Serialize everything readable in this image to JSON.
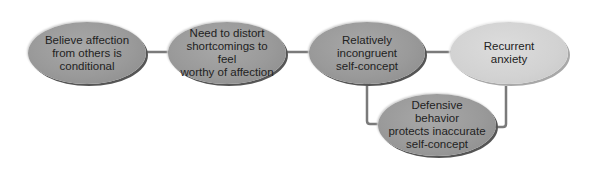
{
  "diagram": {
    "type": "flowchart",
    "nodes": [
      {
        "id": "n1",
        "label": "Believe affection from others is conditional",
        "lines": [
          "Believe affection",
          "from others is",
          "conditional"
        ],
        "shade": "dark"
      },
      {
        "id": "n2",
        "label": "Need to distort shortcomings to feel worthy of affection",
        "lines": [
          "Need to distort",
          "shortcomings to feel",
          "worthy of affection"
        ],
        "shade": "dark"
      },
      {
        "id": "n3",
        "label": "Relatively incongruent self-concept",
        "lines": [
          "Relatively",
          "incongruent",
          "self-concept"
        ],
        "shade": "dark"
      },
      {
        "id": "n4",
        "label": "Recurrent anxiety",
        "lines": [
          "Recurrent",
          "anxiety"
        ],
        "shade": "light"
      },
      {
        "id": "n5",
        "label": "Defensive behavior protects inaccurate self-concept",
        "lines": [
          "Defensive behavior",
          "protects inaccurate",
          "self-concept"
        ],
        "shade": "dark"
      }
    ],
    "edges": [
      {
        "from": "n1",
        "to": "n2"
      },
      {
        "from": "n2",
        "to": "n3"
      },
      {
        "from": "n3",
        "to": "n4"
      },
      {
        "from": "n4",
        "to": "n5"
      },
      {
        "from": "n5",
        "to": "n3"
      }
    ],
    "colors": {
      "dark_node": "#9a9a9a",
      "light_node": "#d2d2d2",
      "edge": "#777777",
      "text": "#222222"
    }
  }
}
